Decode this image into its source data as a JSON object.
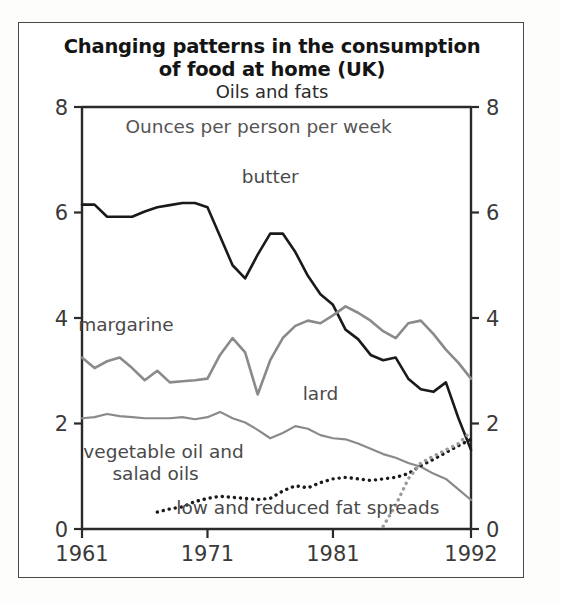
{
  "figure": {
    "title_line1": "Changing patterns in the consumption",
    "title_line2": "of food at home (UK)",
    "subtitle": "Oils and fats",
    "units_note": "Ounces per person per week"
  },
  "chart_data": {
    "type": "line",
    "subtitle": "Oils and fats",
    "xlabel": "",
    "ylabel": "Ounces per person per week",
    "xlim": [
      1961,
      1992
    ],
    "ylim": [
      0,
      8
    ],
    "yticks": [
      0,
      2,
      4,
      6,
      8
    ],
    "ytick_labels": [
      "0",
      "2",
      "4",
      "6",
      "8"
    ],
    "xticks": [
      1961,
      1971,
      1981,
      1992
    ],
    "xtick_labels": [
      "1961",
      "1971",
      "1981",
      "1992"
    ],
    "grid": false,
    "legend": "inline-annotations",
    "dual_y_axis": true,
    "series": [
      {
        "name": "butter",
        "style": "solid",
        "color": "#1a1a1a",
        "width": 2.6,
        "label_x": 1976,
        "label_y": 6.55,
        "x": [
          1961,
          1962,
          1963,
          1964,
          1965,
          1966,
          1967,
          1968,
          1969,
          1970,
          1971,
          1972,
          1973,
          1974,
          1975,
          1976,
          1977,
          1978,
          1979,
          1980,
          1981,
          1982,
          1983,
          1984,
          1985,
          1986,
          1987,
          1988,
          1989,
          1990,
          1991,
          1992
        ],
        "values": [
          6.15,
          6.15,
          5.92,
          5.92,
          5.92,
          6.02,
          6.1,
          6.14,
          6.18,
          6.18,
          6.1,
          5.55,
          5.0,
          4.75,
          5.2,
          5.6,
          5.6,
          5.25,
          4.8,
          4.45,
          4.25,
          3.78,
          3.6,
          3.3,
          3.2,
          3.25,
          2.85,
          2.65,
          2.6,
          2.78,
          2.1,
          1.5
        ]
      },
      {
        "name": "margarine",
        "style": "solid",
        "color": "#8a8a8a",
        "width": 2.6,
        "label_x": 1964.5,
        "label_y": 3.75,
        "x": [
          1961,
          1962,
          1963,
          1964,
          1965,
          1966,
          1967,
          1968,
          1969,
          1970,
          1971,
          1972,
          1973,
          1974,
          1975,
          1976,
          1977,
          1978,
          1979,
          1980,
          1981,
          1982,
          1983,
          1984,
          1985,
          1986,
          1987,
          1988,
          1989,
          1990,
          1991,
          1992
        ],
        "values": [
          3.25,
          3.05,
          3.18,
          3.25,
          3.05,
          2.82,
          3.0,
          2.78,
          2.8,
          2.82,
          2.85,
          3.3,
          3.62,
          3.35,
          2.55,
          3.2,
          3.62,
          3.85,
          3.95,
          3.9,
          4.05,
          4.22,
          4.1,
          3.95,
          3.75,
          3.62,
          3.9,
          3.95,
          3.7,
          3.4,
          3.15,
          2.85
        ]
      },
      {
        "name": "lard",
        "style": "solid",
        "color": "#8a8a8a",
        "width": 2.2,
        "label_x": 1980,
        "label_y": 2.45,
        "x": [
          1961,
          1962,
          1963,
          1964,
          1965,
          1966,
          1967,
          1968,
          1969,
          1970,
          1971,
          1972,
          1973,
          1974,
          1975,
          1976,
          1977,
          1978,
          1979,
          1980,
          1981,
          1982,
          1983,
          1984,
          1985,
          1986,
          1987,
          1988,
          1989,
          1990,
          1991,
          1992
        ],
        "values": [
          2.1,
          2.12,
          2.18,
          2.14,
          2.12,
          2.1,
          2.1,
          2.1,
          2.12,
          2.08,
          2.12,
          2.22,
          2.1,
          2.02,
          1.88,
          1.72,
          1.82,
          1.95,
          1.9,
          1.78,
          1.72,
          1.7,
          1.62,
          1.52,
          1.42,
          1.35,
          1.25,
          1.18,
          1.05,
          0.95,
          0.75,
          0.55
        ]
      },
      {
        "name": "vegetable oil and salad oils",
        "style": "dotted",
        "color": "#1a1a1a",
        "width": 3.4,
        "label_x": 1967.5,
        "label_y": 1.35,
        "label_line1": "vegetable oil and",
        "label_line2": "salad oils",
        "x": [
          1967,
          1968,
          1969,
          1970,
          1971,
          1972,
          1973,
          1974,
          1975,
          1976,
          1977,
          1978,
          1979,
          1980,
          1981,
          1982,
          1983,
          1984,
          1985,
          1986,
          1987,
          1988,
          1989,
          1990,
          1991,
          1992
        ],
        "values": [
          0.32,
          0.38,
          0.42,
          0.52,
          0.58,
          0.62,
          0.6,
          0.58,
          0.56,
          0.58,
          0.72,
          0.82,
          0.78,
          0.88,
          0.95,
          0.98,
          0.95,
          0.92,
          0.95,
          0.98,
          1.05,
          1.2,
          1.32,
          1.45,
          1.58,
          1.7
        ]
      },
      {
        "name": "low and reduced fat spreads",
        "style": "dotted",
        "color": "#9a9a9a",
        "width": 3.4,
        "label_x": 1979,
        "label_y": 0.28,
        "x": [
          1985,
          1986,
          1987,
          1988,
          1989,
          1990,
          1991,
          1992
        ],
        "values": [
          0.05,
          0.45,
          0.95,
          1.25,
          1.38,
          1.5,
          1.62,
          1.85
        ]
      }
    ]
  }
}
